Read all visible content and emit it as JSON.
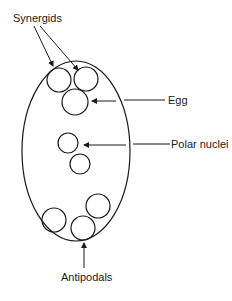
{
  "diagram": {
    "labels": {
      "synergids": "Synergids",
      "egg": "Egg",
      "polar_nuclei": "Polar nuclei",
      "antipodals": "Antipodals"
    },
    "colors": {
      "stroke": "#1a1a1a",
      "background": "#ffffff"
    }
  }
}
